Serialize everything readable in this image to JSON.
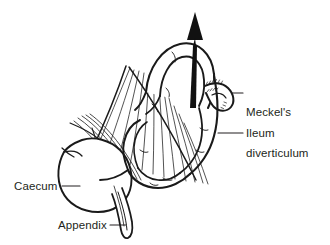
{
  "figure": {
    "type": "anatomical-line-illustration",
    "background_color": "#ffffff",
    "ink_color": "#231f20",
    "line_color": "#1a1a1a",
    "label_color": "#231f20"
  },
  "labels": {
    "meckel": {
      "line1": "Meckel's",
      "line2": "diverticulum"
    },
    "ileum": "Ileum",
    "caecum": "Caecum",
    "appendix": "Appendix"
  },
  "annotations": {
    "arrow": "upward-arrow-through-ileal-loop",
    "leader_lines": 4
  },
  "structures": [
    "ileum",
    "meckels-diverticulum",
    "caecum",
    "appendix",
    "mesentery"
  ]
}
